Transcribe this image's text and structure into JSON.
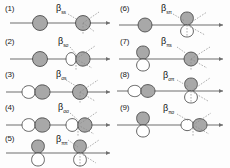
{
  "figure": {
    "type": "orbital-overlap-diagram",
    "columns": 2,
    "panel_count": 9,
    "colors": {
      "lobe_filled": "#a8a8a8",
      "lobe_empty": "#ffffff",
      "outline": "#3d3d3d",
      "axis": "#6f6f6f",
      "dashed": "#8a8a8a",
      "background": "#fdfdfd"
    }
  },
  "panels": [
    {
      "index": "(1)",
      "symbol": "β",
      "subscript": "ss",
      "label": "βss",
      "left_orbital": "s",
      "right_orbital": "s",
      "left_style": "filled",
      "right_style": "filled",
      "column": "left"
    },
    {
      "index": "(2)",
      "symbol": "β",
      "subscript": "sσ",
      "label": "βsσ",
      "left_orbital": "s",
      "right_orbital": "p-sigma",
      "left_style": "filled",
      "right_style": "split",
      "column": "left"
    },
    {
      "index": "(3)",
      "symbol": "β",
      "subscript": "σs",
      "label": "βσs",
      "left_orbital": "p-sigma",
      "right_orbital": "s",
      "left_style": "split",
      "right_style": "filled",
      "column": "left"
    },
    {
      "index": "(4)",
      "symbol": "β",
      "subscript": "σσ",
      "label": "βσσ",
      "left_orbital": "p-sigma",
      "right_orbital": "p-sigma",
      "left_style": "split",
      "right_style": "split",
      "column": "left"
    },
    {
      "index": "(5)",
      "symbol": "β",
      "subscript": "ππ",
      "label": "βππ",
      "left_orbital": "p-pi",
      "right_orbital": "p-pi",
      "left_style": "split",
      "right_style": "split",
      "column": "left"
    },
    {
      "index": "(6)",
      "symbol": "β",
      "subscript": "sπ",
      "label": "βsπ",
      "left_orbital": "s",
      "right_orbital": "p-pi",
      "left_style": "filled",
      "right_style": "split",
      "column": "right"
    },
    {
      "index": "(7)",
      "symbol": "β",
      "subscript": "πs",
      "label": "βπs",
      "left_orbital": "p-pi",
      "right_orbital": "s",
      "left_style": "split",
      "right_style": "filled",
      "column": "right"
    },
    {
      "index": "(8)",
      "symbol": "β",
      "subscript": "σπ",
      "label": "βσπ",
      "left_orbital": "p-sigma",
      "right_orbital": "p-pi",
      "left_style": "split",
      "right_style": "split",
      "column": "right"
    },
    {
      "index": "(9)",
      "symbol": "β",
      "subscript": "πσ",
      "label": "βπσ",
      "left_orbital": "p-pi",
      "right_orbital": "p-sigma",
      "left_style": "split",
      "right_style": "split",
      "column": "right"
    }
  ]
}
